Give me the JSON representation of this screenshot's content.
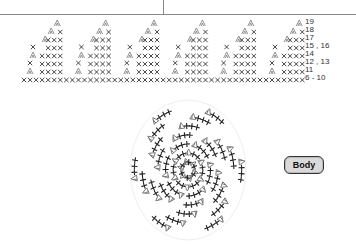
{
  "edge_chart": {
    "description": "Crochet edging chart: repeating scallops of single crochet (x) and increase (V-shaped) stitches",
    "row_labels": [
      {
        "text": "19",
        "y": 22
      },
      {
        "text": "18",
        "y": 30
      },
      {
        "text": "17",
        "y": 38
      },
      {
        "text": "15 , 16",
        "y": 46
      },
      {
        "text": "14",
        "y": 54
      },
      {
        "text": "12 , 13",
        "y": 62
      },
      {
        "text": "11",
        "y": 70
      },
      {
        "text": "6 - 10",
        "y": 78
      }
    ],
    "repeat_count": 6,
    "colors": {
      "stitch": "#333333",
      "increase": "#777777"
    }
  },
  "round_chart": {
    "description": "Circular crochet chart for body worked in spiraling rounds",
    "colors": {
      "stitch": "#222222",
      "increase": "#666666"
    }
  },
  "badge": {
    "label": "Body"
  }
}
